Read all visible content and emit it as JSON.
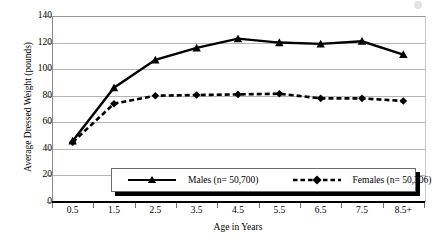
{
  "chart_data": {
    "type": "line",
    "title": "",
    "xlabel": "Age in Years",
    "ylabel": "Average Dressed Weight (pounds)",
    "categories": [
      "0.5",
      "1.5",
      "2.5",
      "3.5",
      "4.5",
      "5.5",
      "6.5",
      "7.5",
      "8.5+"
    ],
    "ylim": [
      0,
      140
    ],
    "yticks": [
      0,
      20,
      40,
      60,
      80,
      100,
      120,
      140
    ],
    "ytick_labels": [
      "0",
      "20",
      "40",
      "60",
      "80",
      "100",
      "120",
      "140"
    ],
    "grid": true,
    "legend_position": "bottom-center-inside",
    "series": [
      {
        "name": "Males (n= 50,700)",
        "marker": "triangle",
        "linestyle": "solid",
        "color": "#000000",
        "values": [
          46,
          86,
          107,
          116,
          123,
          120,
          119,
          121,
          111
        ]
      },
      {
        "name": "Females (n= 50,306)",
        "marker": "diamond",
        "linestyle": "dashed",
        "color": "#000000",
        "values": [
          45,
          74,
          80,
          80.5,
          81,
          81.5,
          78,
          78,
          76
        ]
      }
    ]
  },
  "axes": {
    "y_title": "Average Dressed Weight (pounds)",
    "x_title": "Age in Years"
  },
  "legend": {
    "males_label": "Males (n= 50,700)",
    "females_label": "Females (n= 50,306)"
  }
}
